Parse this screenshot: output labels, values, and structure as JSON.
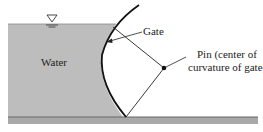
{
  "labels": {
    "water": "Water",
    "gate": "Gate",
    "pin_line1": "Pin (center of",
    "pin_line2": "curvature of gate)"
  },
  "colors": {
    "water_fill": "#bdbdbd",
    "ground_fill": "#a8a8a8",
    "line": "#111111",
    "background": "#ffffff"
  },
  "symbols": {
    "free_surface": "free-surface-triangle-icon"
  }
}
